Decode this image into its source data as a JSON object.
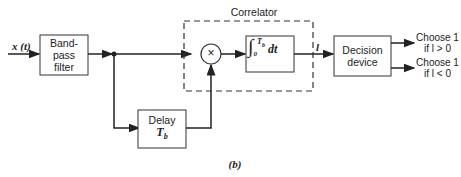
{
  "diagram": {
    "caption": "(b)",
    "input_label": "x (t)",
    "blocks": {
      "bandpass": {
        "line1": "Band-",
        "line2": "pass",
        "line3": "filter"
      },
      "delay": {
        "line1": "Delay",
        "line2": "T_b"
      },
      "correlator": {
        "title": "Correlator",
        "multiplier": "×",
        "integrator": "∫₀^Tb dt"
      },
      "decision": {
        "line1": "Decision",
        "line2": "device"
      }
    },
    "signal_label": "l",
    "outputs": [
      {
        "line1": "Choose 1",
        "line2": "if l > 0"
      },
      {
        "line1": "Choose 1",
        "line2": "if l < 0"
      }
    ]
  }
}
